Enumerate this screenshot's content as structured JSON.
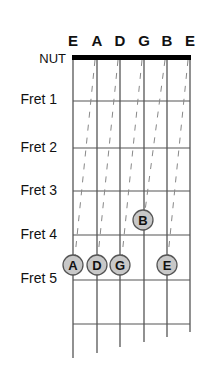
{
  "diagram": {
    "nut_label": "NUT",
    "strings": [
      {
        "name": "E",
        "x": 73,
        "end_y": 358
      },
      {
        "name": "A",
        "x": 97,
        "end_y": 353
      },
      {
        "name": "D",
        "x": 120,
        "end_y": 347
      },
      {
        "name": "G",
        "x": 144,
        "end_y": 342
      },
      {
        "name": "B",
        "x": 167,
        "end_y": 337
      },
      {
        "name": "E",
        "x": 190,
        "end_y": 332
      }
    ],
    "frets": [
      {
        "label": "Fret 1",
        "line_y": 101,
        "label_y": 104
      },
      {
        "label": "Fret 2",
        "line_y": 148,
        "label_y": 152
      },
      {
        "label": "Fret 3",
        "line_y": 191,
        "label_y": 195
      },
      {
        "label": "Fret 4",
        "line_y": 235,
        "label_y": 239
      },
      {
        "label": "Fret 5",
        "line_y": 280,
        "label_y": 283
      },
      {
        "label": "",
        "line_y": 324,
        "label_y": 0
      }
    ],
    "dots": [
      {
        "letter": "A",
        "string_index": 0,
        "x": 73,
        "y": 265
      },
      {
        "letter": "D",
        "string_index": 1,
        "x": 97,
        "y": 265
      },
      {
        "letter": "G",
        "string_index": 2,
        "x": 120,
        "y": 265
      },
      {
        "letter": "B",
        "string_index": 3,
        "x": 143,
        "y": 220
      },
      {
        "letter": "E",
        "string_index": 4,
        "x": 167,
        "y": 265
      }
    ],
    "guide_lines": [
      {
        "from_x": 95,
        "from_y": 60,
        "to_x": 75,
        "to_y": 256
      },
      {
        "from_x": 118,
        "from_y": 60,
        "to_x": 98,
        "to_y": 256
      },
      {
        "from_x": 142,
        "from_y": 60,
        "to_x": 122,
        "to_y": 256
      },
      {
        "from_x": 165,
        "from_y": 60,
        "to_x": 145,
        "to_y": 211
      },
      {
        "from_x": 188,
        "from_y": 60,
        "to_x": 168,
        "to_y": 256
      }
    ],
    "colors": {
      "string": "#555555",
      "fret": "#555555",
      "nut": "#000000",
      "dot_fill": "#c8c8c8",
      "dot_stroke": "#555555",
      "guide": "#888888"
    }
  }
}
